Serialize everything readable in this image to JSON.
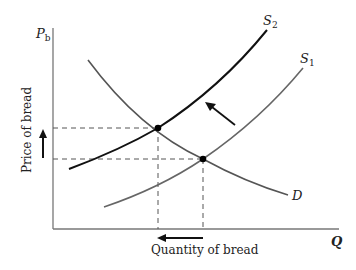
{
  "diagram": {
    "type": "supply-demand",
    "y_axis": {
      "symbol": "P",
      "subscript": "b",
      "label": "Price of bread"
    },
    "x_axis": {
      "symbol": "Q",
      "label": "Quantity of bread"
    },
    "curves": [
      {
        "id": "S2",
        "label": "S",
        "subscript": "2",
        "kind": "supply",
        "style": "bold-black"
      },
      {
        "id": "S1",
        "label": "S",
        "subscript": "1",
        "kind": "supply",
        "style": "gray"
      },
      {
        "id": "D",
        "label": "D",
        "kind": "demand",
        "style": "gray"
      }
    ],
    "equilibria": [
      {
        "id": "E2",
        "between": [
          "S2",
          "D"
        ]
      },
      {
        "id": "E1",
        "between": [
          "S1",
          "D"
        ]
      }
    ],
    "annotations": {
      "supply_shift": "leftward/upward shift from S1 to S2",
      "price_change": "up",
      "quantity_change": "down"
    },
    "colors": {
      "axis": "#777777",
      "s2": "#111111",
      "s1": "#666666",
      "demand": "#555555",
      "dashed": "#555555"
    }
  }
}
